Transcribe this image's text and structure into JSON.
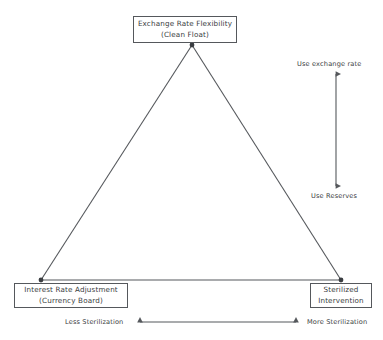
{
  "diagram": {
    "type": "triangle-trilemma",
    "background_color": "#ffffff",
    "line_color": "#55585c",
    "text_color": "#3a3d41",
    "nodes": [
      {
        "id": "exchange-rate-flexibility",
        "line1": "Exchange Rate Flexibility",
        "line2": "(Clean Float)",
        "vertex": "top"
      },
      {
        "id": "interest-rate-adjustment",
        "line1": "Interest Rate Adjustment",
        "line2": "(Currency Board)",
        "vertex": "bottom-left"
      },
      {
        "id": "sterilized-intervention",
        "line1": "Sterilized",
        "line2": "Intervention",
        "vertex": "bottom-right"
      }
    ],
    "vertical_axis": {
      "top_label": "Use exchange rate",
      "bottom_label": "Use Reserves",
      "arrow": "double-headed"
    },
    "horizontal_axis": {
      "left_label": "Less Sterilization",
      "right_label": "More Sterilization",
      "arrow": "double-headed"
    }
  }
}
